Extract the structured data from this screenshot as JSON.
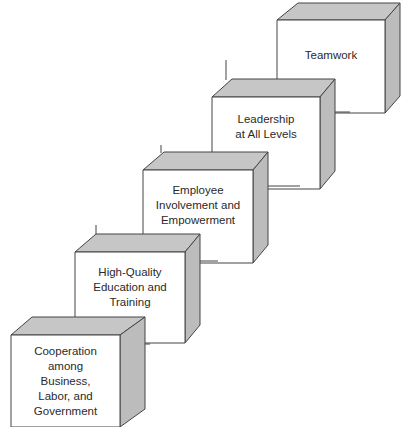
{
  "diagram": {
    "type": "ascending-3d-steps",
    "colors": {
      "front_face": "#ffffff",
      "side_face": "#bdbdbd",
      "top_face": "#c4c4c4",
      "stroke": "#444444"
    },
    "steps": [
      {
        "label": "Cooperation\namong\nBusiness,\nLabor, and\nGovernment"
      },
      {
        "label": "High-Quality\nEducation and\nTraining"
      },
      {
        "label": "Employee\nInvolvement and\nEmpowerment"
      },
      {
        "label": "Leadership\nat All Levels"
      },
      {
        "label": "Teamwork"
      }
    ]
  }
}
